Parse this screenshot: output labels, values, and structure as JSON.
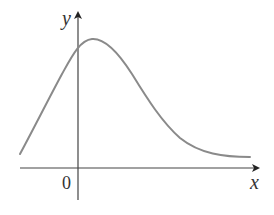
{
  "figure": {
    "type": "function-graph",
    "axes": {
      "x_label": "x",
      "y_label": "y",
      "origin_label": "0"
    },
    "colors": {
      "axis": "#333333",
      "curve": "#8a8a8a",
      "background": "#ffffff"
    }
  }
}
